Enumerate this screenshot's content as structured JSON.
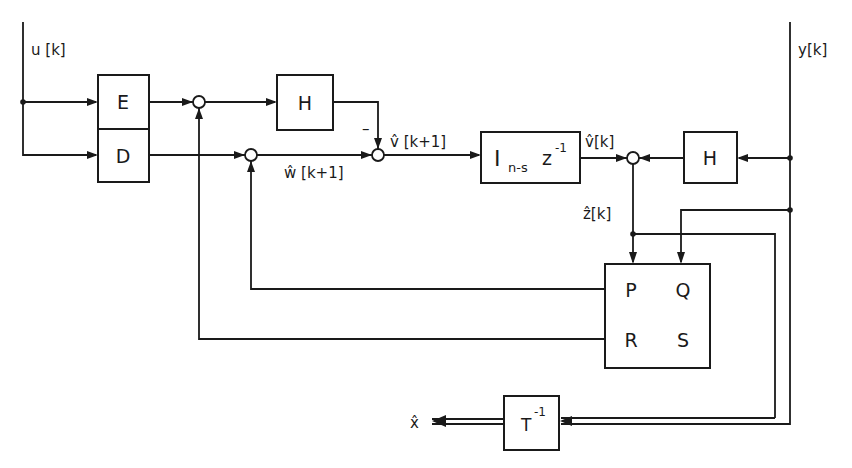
{
  "diagram": {
    "type": "block-diagram",
    "signals": {
      "input_u": "u [k]",
      "input_y": "y[k]",
      "w_hat": "ŵ [k+1]",
      "v_hat_next": "v̂ [k+1]",
      "v_hat": "v̂[k]",
      "z_hat": "ẑ[k]",
      "x_hat": "x̂"
    },
    "blocks": {
      "E": "E",
      "D": "D",
      "H_top": "H",
      "H_right": "H",
      "delay_I": "I",
      "delay_sub": "n-s",
      "delay_z": "z",
      "delay_sup": "-1",
      "P": "P",
      "Q": "Q",
      "R": "R",
      "S": "S",
      "T": "T",
      "T_sup": "-1"
    },
    "signs": {
      "minus": "–"
    }
  }
}
